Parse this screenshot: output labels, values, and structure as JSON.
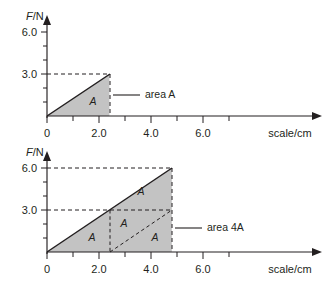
{
  "figure": {
    "title": "",
    "background_color": "#ffffff",
    "ink_color": "#231f20",
    "fill_color": "#c3c3c3"
  },
  "chart_data": [
    {
      "type": "area",
      "id": "top-panel",
      "title": "",
      "xlabel": "scale/cm",
      "ylabel": "F/N",
      "xlim": [
        0,
        7.2
      ],
      "ylim": [
        0,
        7.0
      ],
      "grid": false,
      "legend": "none",
      "x_ticks_labeled": [
        "0",
        "2.0",
        "4.0",
        "6.0"
      ],
      "x_tick_values": [
        0,
        2.0,
        4.0,
        6.0
      ],
      "x_minor_tick_values": [
        1.0,
        3.0,
        5.0
      ],
      "y_ticks_labeled": [
        "3.0",
        "6.0"
      ],
      "y_tick_values": [
        3.0,
        6.0
      ],
      "y_minor_tick_values": [
        1.0,
        2.0,
        4.0,
        5.0
      ],
      "series": [
        {
          "name": "force-vs-extension",
          "kind": "line",
          "x": [
            0,
            2.4
          ],
          "y": [
            0,
            3.0
          ]
        }
      ],
      "shaded_regions": [
        {
          "label": "A",
          "vertices_x": [
            0,
            2.4,
            2.4
          ],
          "vertices_y": [
            0,
            3.0,
            0
          ],
          "label_x": 1.75,
          "label_y": 0.85
        }
      ],
      "guides": [
        {
          "kind": "dashed-horizontal",
          "from_x": 0,
          "to_x": 2.4,
          "y": 3.0
        },
        {
          "kind": "dashed-vertical",
          "x": 2.4,
          "from_y": 0,
          "to_y": 3.0
        }
      ],
      "annotations": [
        {
          "text_prefix": "area ",
          "text_italic": "A",
          "anchor_x": 2.4,
          "anchor_y": 1.45,
          "leader_to_x": 3.35
        }
      ]
    },
    {
      "type": "area",
      "id": "bottom-panel",
      "title": "",
      "xlabel": "scale/cm",
      "ylabel": "F/N",
      "xlim": [
        0,
        7.2
      ],
      "ylim": [
        0,
        7.0
      ],
      "grid": false,
      "legend": "none",
      "x_ticks_labeled": [
        "0",
        "2.0",
        "4.0",
        "6.0"
      ],
      "x_tick_values": [
        0,
        2.0,
        4.0,
        6.0
      ],
      "x_minor_tick_values": [
        1.0,
        3.0,
        5.0
      ],
      "y_ticks_labeled": [
        "3.0",
        "6.0"
      ],
      "y_tick_values": [
        3.0,
        6.0
      ],
      "y_minor_tick_values": [
        1.0,
        2.0,
        4.0,
        5.0
      ],
      "series": [
        {
          "name": "force-vs-extension",
          "kind": "line",
          "x": [
            0,
            4.8
          ],
          "y": [
            0,
            6.0
          ]
        }
      ],
      "shaded_regions": [
        {
          "label": "A",
          "vertices_x": [
            0,
            2.4,
            2.4
          ],
          "vertices_y": [
            0,
            3.0,
            0
          ],
          "label_x": 1.72,
          "label_y": 0.85
        },
        {
          "label": "A",
          "vertices_x": [
            2.4,
            4.8,
            2.4
          ],
          "vertices_y": [
            3.0,
            6.0,
            6.0
          ],
          "label_x": 3.55,
          "label_y": 4.35
        },
        {
          "label": "A",
          "vertices_x": [
            2.4,
            4.8,
            2.4
          ],
          "vertices_y": [
            0,
            3.0,
            3.0
          ],
          "label_x": 2.95,
          "label_y": 2.0
        },
        {
          "label": "A",
          "vertices_x": [
            2.4,
            4.8,
            4.8
          ],
          "vertices_y": [
            0,
            3.0,
            0
          ],
          "label_x": 4.1,
          "label_y": 0.85
        }
      ],
      "guides": [
        {
          "kind": "dashed-horizontal",
          "from_x": 0,
          "to_x": 4.8,
          "y": 6.0
        },
        {
          "kind": "dashed-horizontal",
          "from_x": 0,
          "to_x": 4.8,
          "y": 3.0
        },
        {
          "kind": "dashed-vertical",
          "x": 2.4,
          "from_y": 0,
          "to_y": 3.0
        },
        {
          "kind": "dashed-vertical",
          "x": 4.8,
          "from_y": 0,
          "to_y": 6.0
        },
        {
          "kind": "dashed-diagonal",
          "from_x": 2.4,
          "from_y": 0,
          "to_x": 4.8,
          "to_y": 3.0
        }
      ],
      "annotations": [
        {
          "text_prefix": "area 4",
          "text_italic": "A",
          "anchor_x": 4.8,
          "anchor_y": 1.75,
          "leader_to_x": 5.6
        }
      ]
    }
  ],
  "top": {
    "y_axis_title_var": "F",
    "y_axis_title_rest": "/N",
    "x_axis_title": "scale/cm",
    "y_labels": {
      "high": "6.0",
      "mid": "3.0"
    },
    "x_labels": {
      "origin": "0",
      "two": "2.0",
      "four": "4.0",
      "six": "6.0"
    },
    "region_label": "A",
    "callout_prefix": "area ",
    "callout_italic": "A"
  },
  "bottom": {
    "y_axis_title_var": "F",
    "y_axis_title_rest": "/N",
    "x_axis_title": "scale/cm",
    "y_labels": {
      "high": "6.0",
      "mid": "3.0"
    },
    "x_labels": {
      "origin": "0",
      "two": "2.0",
      "four": "4.0",
      "six": "6.0"
    },
    "region_labels": {
      "lower_left": "A",
      "upper": "A",
      "middle": "A",
      "lower_right": "A"
    },
    "callout_prefix": "area 4",
    "callout_italic": "A"
  }
}
